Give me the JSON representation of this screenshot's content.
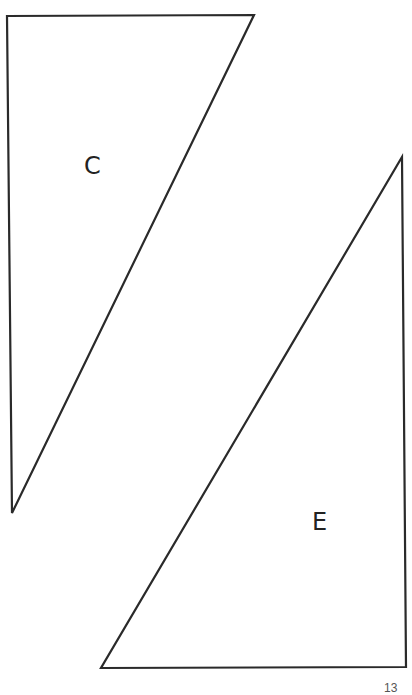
{
  "figure": {
    "shapes": [
      {
        "id": "C",
        "type": "right-triangle",
        "label": "C",
        "vertices": [
          [
            7,
            16
          ],
          [
            254,
            15
          ],
          [
            12,
            513
          ]
        ]
      },
      {
        "id": "E",
        "type": "right-triangle",
        "label": "E",
        "vertices": [
          [
            402,
            157
          ],
          [
            406,
            667
          ],
          [
            101,
            668
          ]
        ]
      }
    ],
    "stroke_color": "#2a2a2a",
    "background": "#ffffff"
  },
  "page_number": "13"
}
